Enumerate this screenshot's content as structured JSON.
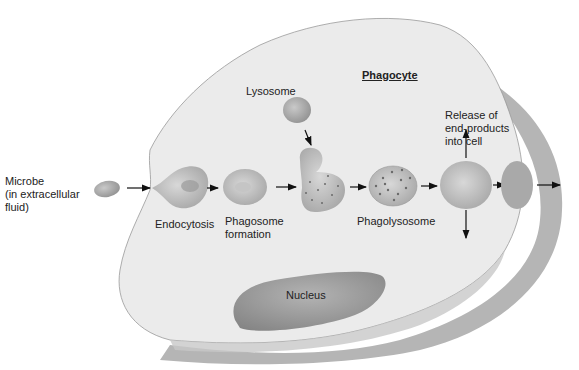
{
  "diagram": {
    "title": "Phagocyte",
    "labels": {
      "microbe": "Microbe\n(in extracellular\nfluid)",
      "endocytosis": "Endocytosis",
      "phagosome": "Phagosome\nformation",
      "lysosome": "Lysosome",
      "phagolysosome": "Phagolysosome",
      "release": "Release of\nend-products\ninto cell",
      "nucleus": "Nucleus"
    },
    "colors": {
      "cell_fill": "#ececec",
      "cell_shadow": "#b9b9b9",
      "organelle": "#a8a8a8",
      "nucleus": "#9e9e9e",
      "arrow": "#111111"
    },
    "steps": [
      "Microbe",
      "Endocytosis",
      "Phagosome formation",
      "Lysosome fusion",
      "Phagolysosome",
      "Release of end-products",
      "Exocytosis"
    ]
  }
}
